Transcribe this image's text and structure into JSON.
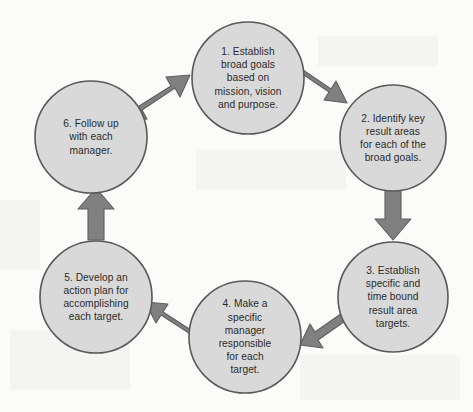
{
  "diagram": {
    "type": "cycle-flow",
    "background_color": "#fbfbfa",
    "node_fill_color": "#d9d9d9",
    "node_border_color": "#595959",
    "arrow_fill_color": "#808080",
    "arrow_border_color": "#595959",
    "text_color": "#2b2b2b",
    "nodes": [
      {
        "id": "step-1",
        "label": "1. Establish\nbroad goals\nbased on\nmission, vision\nand purpose.",
        "cx": 248,
        "cy": 78,
        "r": 56
      },
      {
        "id": "step-2",
        "label": "2. Identify key\nresult areas\nfor each of the\nbroad goals.",
        "cx": 393,
        "cy": 138,
        "r": 53
      },
      {
        "id": "step-3",
        "label": "3. Establish\nspecific and\ntime bound\nresult area\ntargets.",
        "cx": 393,
        "cy": 297,
        "r": 55
      },
      {
        "id": "step-4",
        "label": "4. Make a\nspecific\nmanager\nresponsible\nfor each\ntarget.",
        "cx": 245,
        "cy": 337,
        "r": 56
      },
      {
        "id": "step-5",
        "label": "5. Develop an\naction plan for\naccomplishing\neach target.",
        "cx": 96,
        "cy": 297,
        "r": 56
      },
      {
        "id": "step-6",
        "label": "6. Follow up\nwith each\nmanager.",
        "cx": 91,
        "cy": 137,
        "r": 56
      }
    ],
    "arrows": [
      {
        "id": "arrow-6-to-1",
        "from": "step-6",
        "to": "step-1",
        "direction": "up-right"
      },
      {
        "id": "arrow-1-to-2",
        "from": "step-1",
        "to": "step-2",
        "direction": "down-right"
      },
      {
        "id": "arrow-2-to-3",
        "from": "step-2",
        "to": "step-3",
        "direction": "down"
      },
      {
        "id": "arrow-3-to-4",
        "from": "step-3",
        "to": "step-4",
        "direction": "down-left"
      },
      {
        "id": "arrow-4-to-5",
        "from": "step-4",
        "to": "step-5",
        "direction": "up-left"
      },
      {
        "id": "arrow-5-to-6",
        "from": "step-5",
        "to": "step-6",
        "direction": "up"
      }
    ]
  }
}
